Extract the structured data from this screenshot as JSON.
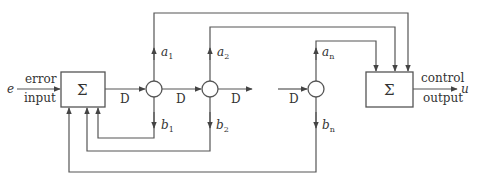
{
  "diagram": {
    "type": "block-diagram",
    "input": {
      "symbol": "e",
      "label_top": "error",
      "label_bottom": "input"
    },
    "output": {
      "symbol": "u",
      "label_top": "control",
      "label_bottom": "output"
    },
    "input_summer": {
      "symbol": "Σ"
    },
    "output_summer": {
      "symbol": "Σ"
    },
    "delay_label": "D",
    "delays": [
      "D",
      "D",
      "D",
      "D"
    ],
    "nodes": [
      {
        "name": "node-1",
        "a": "a",
        "a_sub": "1",
        "b": "b",
        "b_sub": "1"
      },
      {
        "name": "node-2",
        "a": "a",
        "a_sub": "2",
        "b": "b",
        "b_sub": "2"
      },
      {
        "name": "node-n",
        "a": "a",
        "a_sub": "n",
        "b": "b",
        "b_sub": "n"
      }
    ]
  }
}
